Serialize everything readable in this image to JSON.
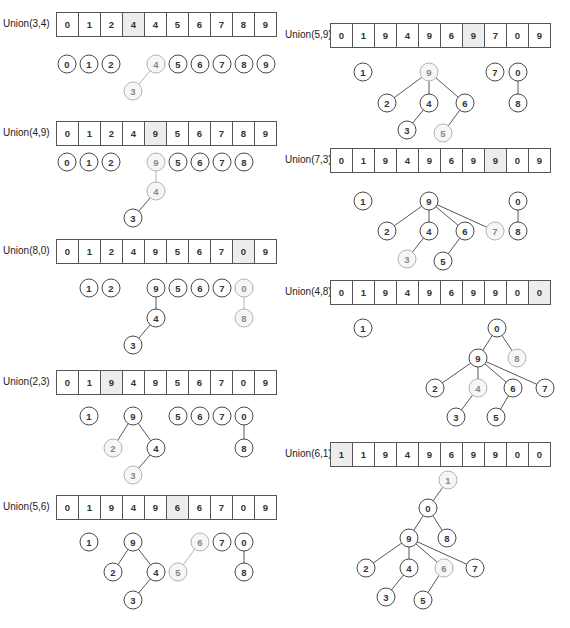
{
  "steps": [
    {
      "label": "Union(3,4)",
      "pos": {
        "lx": 3,
        "ly": 18,
        "ax": 56,
        "ay": 12
      },
      "array": [
        "0",
        "1",
        "2",
        "4",
        "4",
        "5",
        "6",
        "7",
        "8",
        "9"
      ],
      "highlight_index": 3,
      "tree_origin": {
        "x": 0,
        "y": 0
      },
      "nodes": [
        {
          "v": "0",
          "x": 67,
          "y": 64
        },
        {
          "v": "1",
          "x": 89,
          "y": 64
        },
        {
          "v": "2",
          "x": 111,
          "y": 64
        },
        {
          "v": "4",
          "x": 156,
          "y": 64,
          "hl": true
        },
        {
          "v": "5",
          "x": 178,
          "y": 64
        },
        {
          "v": "6",
          "x": 200,
          "y": 64
        },
        {
          "v": "7",
          "x": 222,
          "y": 64
        },
        {
          "v": "8",
          "x": 244,
          "y": 64
        },
        {
          "v": "9",
          "x": 266,
          "y": 64
        },
        {
          "v": "3",
          "x": 133,
          "y": 91,
          "hl": true
        }
      ],
      "edges": [
        {
          "a": "4",
          "b": "3",
          "hl": true
        }
      ]
    },
    {
      "label": "Union(4,9)",
      "pos": {
        "lx": 3,
        "ly": 127,
        "ax": 56,
        "ay": 121
      },
      "array": [
        "0",
        "1",
        "2",
        "4",
        "9",
        "5",
        "6",
        "7",
        "8",
        "9"
      ],
      "highlight_index": 4,
      "nodes": [
        {
          "v": "0",
          "x": 67,
          "y": 162
        },
        {
          "v": "1",
          "x": 89,
          "y": 162
        },
        {
          "v": "2",
          "x": 111,
          "y": 162
        },
        {
          "v": "9",
          "x": 156,
          "y": 162,
          "hl": true
        },
        {
          "v": "5",
          "x": 178,
          "y": 162
        },
        {
          "v": "6",
          "x": 200,
          "y": 162
        },
        {
          "v": "7",
          "x": 222,
          "y": 162
        },
        {
          "v": "8",
          "x": 244,
          "y": 162
        },
        {
          "v": "4",
          "x": 156,
          "y": 191,
          "hl": true
        },
        {
          "v": "3",
          "x": 133,
          "y": 218
        }
      ],
      "edges": [
        {
          "a": "9",
          "b": "4",
          "hl": true
        },
        {
          "a": "4",
          "b": "3"
        }
      ]
    },
    {
      "label": "Union(8,0)",
      "pos": {
        "lx": 3,
        "ly": 245,
        "ax": 56,
        "ay": 239
      },
      "array": [
        "0",
        "1",
        "2",
        "4",
        "9",
        "5",
        "6",
        "7",
        "0",
        "9"
      ],
      "highlight_index": 8,
      "nodes": [
        {
          "v": "1",
          "x": 89,
          "y": 288
        },
        {
          "v": "2",
          "x": 111,
          "y": 288
        },
        {
          "v": "9",
          "x": 156,
          "y": 288
        },
        {
          "v": "5",
          "x": 178,
          "y": 288
        },
        {
          "v": "6",
          "x": 200,
          "y": 288
        },
        {
          "v": "7",
          "x": 222,
          "y": 288
        },
        {
          "v": "0",
          "x": 244,
          "y": 288,
          "hl": true
        },
        {
          "v": "4",
          "x": 156,
          "y": 318
        },
        {
          "v": "8",
          "x": 244,
          "y": 318,
          "hl": true
        },
        {
          "v": "3",
          "x": 133,
          "y": 345
        }
      ],
      "edges": [
        {
          "a": "9",
          "b": "4"
        },
        {
          "a": "4",
          "b": "3"
        },
        {
          "a": "0",
          "b": "8",
          "hl": true
        }
      ]
    },
    {
      "label": "Union(2,3)",
      "pos": {
        "lx": 3,
        "ly": 376,
        "ax": 56,
        "ay": 370
      },
      "array": [
        "0",
        "1",
        "9",
        "4",
        "9",
        "5",
        "6",
        "7",
        "0",
        "9"
      ],
      "highlight_index": 2,
      "nodes": [
        {
          "v": "1",
          "x": 89,
          "y": 416
        },
        {
          "v": "9",
          "x": 133,
          "y": 416
        },
        {
          "v": "5",
          "x": 178,
          "y": 416
        },
        {
          "v": "6",
          "x": 200,
          "y": 416
        },
        {
          "v": "7",
          "x": 222,
          "y": 416
        },
        {
          "v": "0",
          "x": 244,
          "y": 416
        },
        {
          "v": "2",
          "x": 113,
          "y": 448,
          "hl": true
        },
        {
          "v": "4",
          "x": 156,
          "y": 448
        },
        {
          "v": "8",
          "x": 244,
          "y": 448
        },
        {
          "v": "3",
          "x": 133,
          "y": 475,
          "hl": true
        }
      ],
      "edges": [
        {
          "a": "9",
          "b": "2"
        },
        {
          "a": "9",
          "b": "4"
        },
        {
          "a": "4",
          "b": "3"
        },
        {
          "a": "0",
          "b": "8"
        }
      ]
    },
    {
      "label": "Union(5,6)",
      "pos": {
        "lx": 3,
        "ly": 501,
        "ax": 56,
        "ay": 495
      },
      "array": [
        "0",
        "1",
        "9",
        "4",
        "9",
        "6",
        "6",
        "7",
        "0",
        "9"
      ],
      "highlight_index": 5,
      "nodes": [
        {
          "v": "1",
          "x": 89,
          "y": 542
        },
        {
          "v": "9",
          "x": 133,
          "y": 542
        },
        {
          "v": "6",
          "x": 200,
          "y": 542,
          "hl": true
        },
        {
          "v": "7",
          "x": 222,
          "y": 542
        },
        {
          "v": "0",
          "x": 244,
          "y": 542
        },
        {
          "v": "2",
          "x": 113,
          "y": 572
        },
        {
          "v": "4",
          "x": 156,
          "y": 572
        },
        {
          "v": "5",
          "x": 178,
          "y": 572,
          "hl": true
        },
        {
          "v": "8",
          "x": 244,
          "y": 572
        },
        {
          "v": "3",
          "x": 133,
          "y": 600
        }
      ],
      "edges": [
        {
          "a": "9",
          "b": "2"
        },
        {
          "a": "9",
          "b": "4"
        },
        {
          "a": "4",
          "b": "3"
        },
        {
          "a": "6",
          "b": "5",
          "hl": true
        },
        {
          "a": "0",
          "b": "8"
        }
      ]
    },
    {
      "label": "Union(5,9)",
      "pos": {
        "lx": 285,
        "ly": 29,
        "ax": 330,
        "ay": 23
      },
      "array": [
        "0",
        "1",
        "9",
        "4",
        "9",
        "6",
        "9",
        "7",
        "0",
        "9"
      ],
      "highlight_index": 6,
      "nodes": [
        {
          "v": "1",
          "x": 363,
          "y": 72
        },
        {
          "v": "9",
          "x": 429,
          "y": 72,
          "hl": true
        },
        {
          "v": "7",
          "x": 495,
          "y": 72
        },
        {
          "v": "0",
          "x": 518,
          "y": 72
        },
        {
          "v": "2",
          "x": 387,
          "y": 103
        },
        {
          "v": "4",
          "x": 429,
          "y": 103
        },
        {
          "v": "6",
          "x": 465,
          "y": 103
        },
        {
          "v": "8",
          "x": 518,
          "y": 103
        },
        {
          "v": "3",
          "x": 407,
          "y": 130
        },
        {
          "v": "5",
          "x": 443,
          "y": 133,
          "hl": true
        }
      ],
      "edges": [
        {
          "a": "9",
          "b": "2"
        },
        {
          "a": "9",
          "b": "4"
        },
        {
          "a": "9",
          "b": "6"
        },
        {
          "a": "4",
          "b": "3"
        },
        {
          "a": "6",
          "b": "5"
        },
        {
          "a": "0",
          "b": "8"
        }
      ]
    },
    {
      "label": "Union(7,3)",
      "pos": {
        "lx": 285,
        "ly": 154,
        "ax": 330,
        "ay": 148
      },
      "array": [
        "0",
        "1",
        "9",
        "4",
        "9",
        "6",
        "9",
        "9",
        "0",
        "9"
      ],
      "highlight_index": 7,
      "nodes": [
        {
          "v": "1",
          "x": 363,
          "y": 201
        },
        {
          "v": "9",
          "x": 429,
          "y": 201
        },
        {
          "v": "0",
          "x": 518,
          "y": 201
        },
        {
          "v": "2",
          "x": 387,
          "y": 231
        },
        {
          "v": "4",
          "x": 429,
          "y": 231
        },
        {
          "v": "6",
          "x": 465,
          "y": 231
        },
        {
          "v": "7",
          "x": 495,
          "y": 231,
          "hl": true
        },
        {
          "v": "8",
          "x": 518,
          "y": 231
        },
        {
          "v": "3",
          "x": 407,
          "y": 259,
          "hl": true
        },
        {
          "v": "5",
          "x": 443,
          "y": 261
        }
      ],
      "edges": [
        {
          "a": "9",
          "b": "2"
        },
        {
          "a": "9",
          "b": "4"
        },
        {
          "a": "9",
          "b": "6"
        },
        {
          "a": "9",
          "b": "7"
        },
        {
          "a": "4",
          "b": "3"
        },
        {
          "a": "6",
          "b": "5"
        },
        {
          "a": "0",
          "b": "8"
        }
      ]
    },
    {
      "label": "Union(4,8)",
      "pos": {
        "lx": 285,
        "ly": 286,
        "ax": 330,
        "ay": 280
      },
      "array": [
        "0",
        "1",
        "9",
        "4",
        "9",
        "6",
        "9",
        "9",
        "0",
        "0"
      ],
      "highlight_index": 9,
      "nodes": [
        {
          "v": "1",
          "x": 363,
          "y": 328
        },
        {
          "v": "0",
          "x": 497,
          "y": 328
        },
        {
          "v": "9",
          "x": 478,
          "y": 358
        },
        {
          "v": "8",
          "x": 517,
          "y": 358,
          "hl": true
        },
        {
          "v": "2",
          "x": 435,
          "y": 388
        },
        {
          "v": "4",
          "x": 478,
          "y": 388,
          "hl": true
        },
        {
          "v": "6",
          "x": 513,
          "y": 388
        },
        {
          "v": "7",
          "x": 545,
          "y": 388
        },
        {
          "v": "3",
          "x": 456,
          "y": 417
        },
        {
          "v": "5",
          "x": 496,
          "y": 417
        }
      ],
      "edges": [
        {
          "a": "0",
          "b": "9"
        },
        {
          "a": "0",
          "b": "8"
        },
        {
          "a": "9",
          "b": "2"
        },
        {
          "a": "9",
          "b": "4"
        },
        {
          "a": "9",
          "b": "6"
        },
        {
          "a": "9",
          "b": "7"
        },
        {
          "a": "4",
          "b": "3"
        },
        {
          "a": "6",
          "b": "5"
        }
      ]
    },
    {
      "label": "Union(6,1)",
      "pos": {
        "lx": 285,
        "ly": 448,
        "ax": 330,
        "ay": 442
      },
      "array": [
        "1",
        "1",
        "9",
        "4",
        "9",
        "6",
        "9",
        "9",
        "0",
        "0"
      ],
      "highlight_index": 0,
      "nodes": [
        {
          "v": "1",
          "x": 448,
          "y": 480,
          "hl": true
        },
        {
          "v": "0",
          "x": 428,
          "y": 508
        },
        {
          "v": "9",
          "x": 409,
          "y": 538
        },
        {
          "v": "8",
          "x": 447,
          "y": 538
        },
        {
          "v": "2",
          "x": 366,
          "y": 568
        },
        {
          "v": "4",
          "x": 409,
          "y": 568
        },
        {
          "v": "6",
          "x": 444,
          "y": 568,
          "hl": true
        },
        {
          "v": "7",
          "x": 475,
          "y": 568
        },
        {
          "v": "3",
          "x": 386,
          "y": 597
        },
        {
          "v": "5",
          "x": 423,
          "y": 600
        }
      ],
      "edges": [
        {
          "a": "1",
          "b": "0"
        },
        {
          "a": "0",
          "b": "9"
        },
        {
          "a": "0",
          "b": "8"
        },
        {
          "a": "9",
          "b": "2"
        },
        {
          "a": "9",
          "b": "4"
        },
        {
          "a": "9",
          "b": "6"
        },
        {
          "a": "9",
          "b": "7"
        },
        {
          "a": "4",
          "b": "3"
        },
        {
          "a": "6",
          "b": "5"
        }
      ]
    }
  ],
  "colors": {
    "highlight_cell": "#ededed",
    "node_stroke": "#333333",
    "highlight_stroke": "#aaaaaa"
  }
}
